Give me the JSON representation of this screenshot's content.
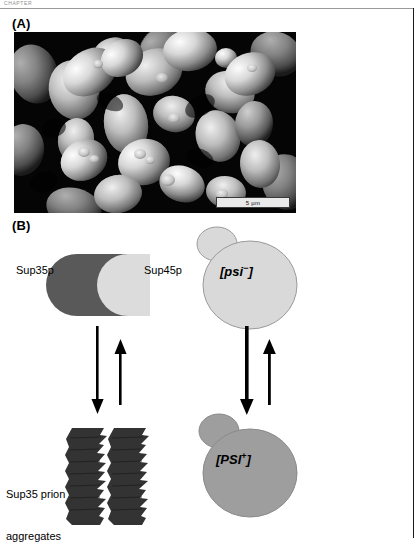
{
  "running_head": "CHAPTER",
  "panels": {
    "a": {
      "label": "(A)",
      "image_kind": "sem-micrograph-budding-yeast",
      "scale_bar": "5 µm"
    },
    "b": {
      "label": "(B)",
      "labels": {
        "sup35p": "Sup35p",
        "sup45p": "Sup45p",
        "aggregates_line1": "Sup35 prion",
        "aggregates_line2": "aggregates"
      },
      "cells": [
        {
          "id": "psi-minus",
          "tag": "[psi",
          "superscript": "−",
          "close": "]",
          "fill": "#d9d9d9"
        },
        {
          "id": "psi-plus",
          "tag": "[PSI",
          "superscript": "+",
          "close": "]",
          "fill": "#9e9e9e"
        }
      ],
      "complex": {
        "sup35_fill": "#595959",
        "sup45_fill": "#dcdcdc"
      },
      "aggregate_fill": "#333333",
      "arrows": [
        {
          "id": "left-forward",
          "direction": "down",
          "weight": "thin"
        },
        {
          "id": "left-reverse",
          "direction": "up",
          "weight": "thin"
        },
        {
          "id": "right-forward",
          "direction": "down",
          "weight": "thick"
        },
        {
          "id": "right-reverse",
          "direction": "up",
          "weight": "thin"
        }
      ]
    }
  },
  "colors": {
    "rule": "#9a9a9a",
    "border": "#1a1a1a",
    "ink": "#000000"
  }
}
